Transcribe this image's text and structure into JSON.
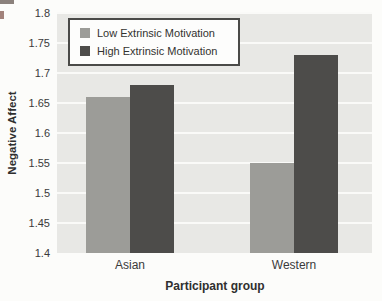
{
  "chart_data": {
    "type": "bar",
    "categories": [
      "Asian",
      "Western"
    ],
    "series": [
      {
        "name": "Low Extrinsic Motivation",
        "values": [
          1.66,
          1.55
        ],
        "color": "#9c9c98"
      },
      {
        "name": "High Extrinsic Motivation",
        "values": [
          1.68,
          1.73
        ],
        "color": "#4d4c4a"
      }
    ],
    "title": "",
    "xlabel": "Participant group",
    "ylabel": "Negative Affect",
    "ylim": [
      1.4,
      1.8
    ],
    "ytick_step": 0.05,
    "yticks": [
      "1.8",
      "1.75",
      "1.7",
      "1.65",
      "1.6",
      "1.55",
      "1.5",
      "1.45",
      "1.4"
    ],
    "grid": true,
    "grid_color": "#fafaf8",
    "plot_bg": "#e8e8e5",
    "legend_position": "top-left"
  }
}
